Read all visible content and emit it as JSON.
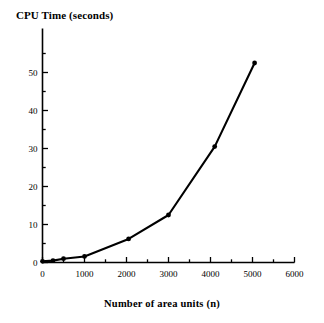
{
  "chart_data": {
    "type": "line",
    "title": "",
    "ylabel": "CPU Time (seconds)",
    "xlabel": "Number of area units (n)",
    "xlim": [
      0,
      6000
    ],
    "ylim": [
      0,
      57
    ],
    "xticks": [
      0,
      1000,
      2000,
      3000,
      4000,
      5000,
      6000
    ],
    "xtick_labels": [
      "0",
      "1000",
      "2000",
      "3000",
      "4000",
      "5000",
      "6000"
    ],
    "yticks": [
      0,
      10,
      20,
      30,
      40,
      50
    ],
    "ytick_labels": [
      "0",
      "10",
      "20",
      "30",
      "40",
      "50"
    ],
    "x_minor_step": 500,
    "y_minor_step": 5,
    "grid": false,
    "legend": false,
    "marker": "filled-circle",
    "line_color": "#000000",
    "marker_color": "#000000",
    "series": [
      {
        "name": "CPU Time",
        "x": [
          0,
          250,
          500,
          1000,
          2050,
          3000,
          4100,
          5050
        ],
        "values": [
          0.3,
          0.5,
          1.0,
          1.6,
          6.2,
          12.5,
          30.5,
          52.5
        ]
      }
    ]
  }
}
